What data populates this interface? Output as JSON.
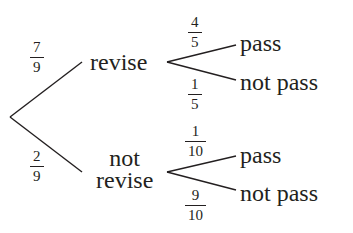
{
  "diagram": {
    "type": "probability tree",
    "root": {
      "branches": [
        {
          "label": "revise",
          "probability": {
            "num": "7",
            "den": "9"
          },
          "children": [
            {
              "label": "pass",
              "probability": {
                "num": "4",
                "den": "5"
              }
            },
            {
              "label": "not pass",
              "probability": {
                "num": "1",
                "den": "5"
              }
            }
          ]
        },
        {
          "label_line1": "not",
          "label_line2": "revise",
          "probability": {
            "num": "2",
            "den": "9"
          },
          "children": [
            {
              "label": "pass",
              "probability": {
                "num": "1",
                "den": "10"
              }
            },
            {
              "label": "not pass",
              "probability": {
                "num": "9",
                "den": "10"
              }
            }
          ]
        }
      ]
    },
    "colors": {
      "ink": "#231f20",
      "background": "#ffffff"
    }
  }
}
